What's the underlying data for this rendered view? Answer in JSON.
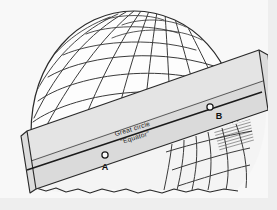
{
  "figure": {
    "background_color": "#f2f2f2",
    "paper_color": "#fbfbfb",
    "band_color": "#e2e2e2",
    "band_shadow_color": "#cfcfcf",
    "ink_color": "#1a1a1a",
    "grid_color": "#3a3a3a"
  },
  "annotations": {
    "great_circle_label": "Great circle",
    "equator_label": "\"Equator\"",
    "label_rotation_deg": -17
  },
  "points": [
    {
      "id": "A",
      "label": "A",
      "x": 105,
      "y": 155,
      "label_x": 104,
      "label_y": 169
    },
    {
      "id": "B",
      "label": "B",
      "x": 210,
      "y": 107,
      "label_x": 217,
      "label_y": 118
    }
  ],
  "great_circle_line": {
    "start_x": 27,
    "start_y": 170,
    "end_x": 257,
    "end_y": 95
  },
  "sphere": {
    "center_x": 133,
    "center_y": 118,
    "radius_x": 104,
    "radius_y": 104,
    "parallels_count": 5,
    "meridians_count": 9
  },
  "band": {
    "top_edge_left_y": 128,
    "top_edge_right_y": 52,
    "bottom_edge_left_y": 186,
    "bottom_edge_right_y": 112,
    "tilt_deg": -18
  }
}
